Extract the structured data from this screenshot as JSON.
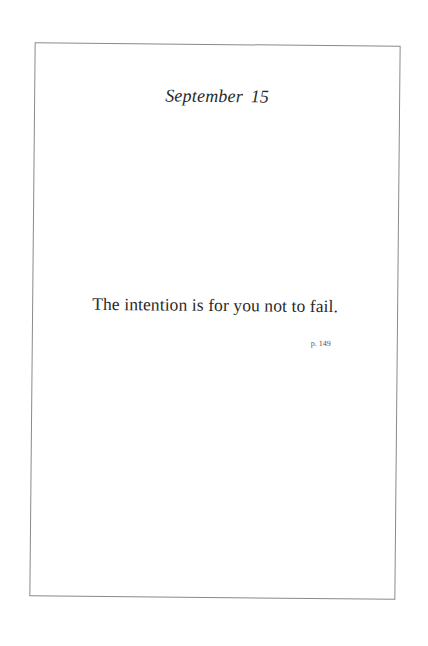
{
  "page": {
    "date_heading": "September 15",
    "quote": "The intention is for you not to fail.",
    "page_reference": "p. 149"
  },
  "colors": {
    "border": "#8a8a8a",
    "text": "#2a2a2a",
    "background": "#ffffff"
  }
}
